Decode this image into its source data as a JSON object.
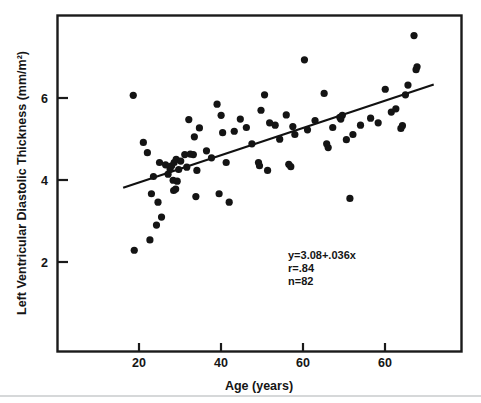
{
  "chart_data": {
    "type": "scatter",
    "title": "",
    "xlabel": "Age (years)",
    "ylabel": "Left Ventricular Diastolic Thickness (mm/m²)",
    "xlim": [
      10,
      90
    ],
    "ylim": [
      0.4,
      7.6
    ],
    "xticks": [
      20,
      40,
      60,
      60
    ],
    "yticks": [
      2,
      4,
      6
    ],
    "grid": false,
    "legend": null,
    "annotations": {
      "equation": "y=3.08+.036x",
      "correlation": "r=.84",
      "sample_size": "n=82"
    },
    "fit_line": {
      "type": "linear",
      "slope": 0.036,
      "intercept": 3.08,
      "x_start": 23.0,
      "x_end": 84.5,
      "y_start": 3.91,
      "y_end": 6.12
    },
    "series": [
      {
        "name": "patients",
        "marker": "filled-circle",
        "color": "#141414",
        "points": [
          [
            25.2,
            2.57
          ],
          [
            28.3,
            2.79
          ],
          [
            29.6,
            3.11
          ],
          [
            30.6,
            3.28
          ],
          [
            29.9,
            3.6
          ],
          [
            28.6,
            3.78
          ],
          [
            33.0,
            3.85
          ],
          [
            33.4,
            3.88
          ],
          [
            32.9,
            4.07
          ],
          [
            33.7,
            4.05
          ],
          [
            31.9,
            4.2
          ],
          [
            32.3,
            4.31
          ],
          [
            32.6,
            4.38
          ],
          [
            33.1,
            4.45
          ],
          [
            33.5,
            4.52
          ],
          [
            34.4,
            4.48
          ],
          [
            35.2,
            4.62
          ],
          [
            36.3,
            4.63
          ],
          [
            36.9,
            4.62
          ],
          [
            35.6,
            4.35
          ],
          [
            37.6,
            4.28
          ],
          [
            37.1,
            5.0
          ],
          [
            36.0,
            5.37
          ],
          [
            38.1,
            5.19
          ],
          [
            37.4,
            3.72
          ],
          [
            41.6,
            5.7
          ],
          [
            42.4,
            5.46
          ],
          [
            42.7,
            5.09
          ],
          [
            42.0,
            3.78
          ],
          [
            43.4,
            4.45
          ],
          [
            44.0,
            3.6
          ],
          [
            46.2,
            5.38
          ],
          [
            47.4,
            5.2
          ],
          [
            49.8,
            4.45
          ],
          [
            50.0,
            4.38
          ],
          [
            50.3,
            5.57
          ],
          [
            51.0,
            5.9
          ],
          [
            51.6,
            4.28
          ],
          [
            53.1,
            5.25
          ],
          [
            55.3,
            5.47
          ],
          [
            55.8,
            4.41
          ],
          [
            56.2,
            4.36
          ],
          [
            56.6,
            5.22
          ],
          [
            58.9,
            6.65
          ],
          [
            27.0,
            4.88
          ],
          [
            27.8,
            4.66
          ],
          [
            25.0,
            5.89
          ],
          [
            62.8,
            5.93
          ],
          [
            63.6,
            4.77
          ],
          [
            63.3,
            4.85
          ],
          [
            65.9,
            5.42
          ],
          [
            66.1,
            5.38
          ],
          [
            66.4,
            5.46
          ],
          [
            67.2,
            4.94
          ],
          [
            67.9,
            3.68
          ],
          [
            74.9,
            6.02
          ],
          [
            76.1,
            5.53
          ],
          [
            78.0,
            5.18
          ],
          [
            78.3,
            5.24
          ],
          [
            78.9,
            5.9
          ],
          [
            79.4,
            6.11
          ],
          [
            81.0,
            6.44
          ],
          [
            81.2,
            6.5
          ],
          [
            80.6,
            7.17
          ],
          [
            30.2,
            4.45
          ],
          [
            31.4,
            4.4
          ],
          [
            34.0,
            4.3
          ],
          [
            39.5,
            4.7
          ],
          [
            45.0,
            5.12
          ],
          [
            48.5,
            4.85
          ],
          [
            52.0,
            5.3
          ],
          [
            54.0,
            4.95
          ],
          [
            57.0,
            5.05
          ],
          [
            59.5,
            5.15
          ],
          [
            61.0,
            5.35
          ],
          [
            64.5,
            5.2
          ],
          [
            68.5,
            5.05
          ],
          [
            70.0,
            5.25
          ],
          [
            72.0,
            5.4
          ],
          [
            73.5,
            5.3
          ],
          [
            77.0,
            5.6
          ],
          [
            29.0,
            4.15
          ],
          [
            40.5,
            4.55
          ]
        ]
      }
    ]
  },
  "axes": {
    "x_title": "Age (years)",
    "y_title": "Left Ventricular Diastolic Thickness (mm/m²)",
    "x_tick_labels": [
      "20",
      "40",
      "60",
      "60"
    ],
    "y_tick_labels": [
      "6",
      "4",
      "2"
    ]
  },
  "annotation": {
    "line1": "y=3.08+.036x",
    "line2": "r=.84",
    "line3": "n=82"
  },
  "colors": {
    "ink": "#141414",
    "frame": "#1a1a1a",
    "background": "#ffffff",
    "footer_rule": "#c9cbcd"
  }
}
